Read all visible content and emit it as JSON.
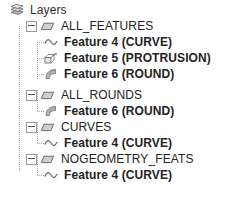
{
  "panel": {
    "title": "Layers",
    "root_icon": "layers-icon"
  },
  "tree": {
    "nodes": [
      {
        "id": "root",
        "label": "Layers",
        "level": "root",
        "icon": "layers-icon",
        "expanded": true,
        "has_toggle": false
      },
      {
        "id": "all_features",
        "label": "ALL_FEATURES",
        "level": "group",
        "icon": "disc-icon",
        "expanded": true,
        "has_toggle": true,
        "toggle_state": "minus"
      },
      {
        "id": "all_features_f4",
        "label": "Feature 4 (CURVE)",
        "level": "leaf",
        "icon": "curve-icon",
        "has_toggle": false
      },
      {
        "id": "all_features_f5",
        "label": "Feature 5 (PROTRUSION)",
        "level": "leaf",
        "icon": "protrusion-icon",
        "has_toggle": false
      },
      {
        "id": "all_features_f6",
        "label": "Feature 6 (ROUND)",
        "level": "leaf",
        "icon": "round-icon",
        "has_toggle": false
      },
      {
        "id": "all_rounds",
        "label": "ALL_ROUNDS",
        "level": "group",
        "icon": "disc-icon",
        "expanded": true,
        "has_toggle": true,
        "toggle_state": "minus"
      },
      {
        "id": "all_rounds_f6",
        "label": "Feature 6 (ROUND)",
        "level": "leaf",
        "icon": "round-icon",
        "has_toggle": false
      },
      {
        "id": "curves",
        "label": "CURVES",
        "level": "group",
        "icon": "disc-icon",
        "expanded": true,
        "has_toggle": true,
        "toggle_state": "minus"
      },
      {
        "id": "curves_f4",
        "label": "Feature 4 (CURVE)",
        "level": "leaf",
        "icon": "curve-icon",
        "has_toggle": false
      },
      {
        "id": "nogeometry_feats",
        "label": "NOGEOMETRY_FEATS",
        "level": "group",
        "icon": "disc-icon",
        "expanded": true,
        "has_toggle": true,
        "toggle_state": "minus"
      },
      {
        "id": "nogeometry_feats_f4",
        "label": "Feature 4 (CURVE)",
        "level": "leaf",
        "icon": "curve-icon",
        "has_toggle": false
      }
    ]
  },
  "colors": {
    "background": "#ffffff",
    "text": "#232323",
    "line": "#a8a8a8",
    "icon_gray": "#8c8c8c",
    "icon_outline": "#6e6e6e"
  }
}
